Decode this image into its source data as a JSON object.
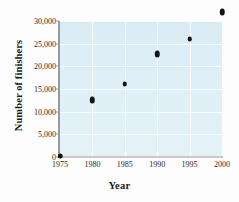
{
  "chart_data": {
    "type": "scatter",
    "title": "",
    "xlabel": "Year",
    "ylabel": "Number of finishers",
    "xlim": [
      1975,
      2000
    ],
    "ylim": [
      0,
      30000
    ],
    "grid": true,
    "legend": "none",
    "x": [
      1975,
      1980,
      1985,
      1990,
      1995,
      2000
    ],
    "values": [
      300,
      12500,
      16000,
      22700,
      26000,
      32000
    ],
    "series": [
      {
        "name": "Number of finishers",
        "points": [
          {
            "x": 1975,
            "y": 300
          },
          {
            "x": 1980,
            "y": 12500
          },
          {
            "x": 1985,
            "y": 16000
          },
          {
            "x": 1990,
            "y": 22700
          },
          {
            "x": 1995,
            "y": 26000
          },
          {
            "x": 2000,
            "y": 32000
          }
        ]
      }
    ],
    "xticks": [
      1975,
      1980,
      1985,
      1990,
      1995,
      2000
    ],
    "xtick_labels": [
      "1975",
      "1980",
      "1985",
      "1990",
      "1995",
      "2000"
    ],
    "yticks": [
      0,
      5000,
      10000,
      15000,
      20000,
      25000,
      30000
    ],
    "ytick_labels": [
      "0",
      "5,000",
      "10,000",
      "15,000",
      "20,000",
      "25,000",
      "30,000"
    ],
    "colors": {
      "marker": "#131313",
      "plot_background": "#dceef6",
      "gridline": "#fbfdfe",
      "axis": "#9a9a9a",
      "text": "#1b1b1b",
      "figure_background": "#fdfdfe"
    }
  }
}
